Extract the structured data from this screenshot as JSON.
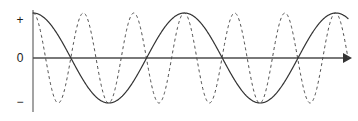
{
  "figure": {
    "title": "",
    "background_color": "#ffffff",
    "width": 358,
    "height": 121
  },
  "axes": {
    "x_axis": {
      "name": "horizontal-axis",
      "color": "#4d4d4d",
      "arrow": true,
      "arrow_direction": "right",
      "y_pixel": 58,
      "x_start_pixel": 33,
      "x_end_pixel": 350
    },
    "y_axis": {
      "name": "vertical-axis",
      "color": "#8c8c8c",
      "arrow": false,
      "x_pixel": 33,
      "y_top_pixel": 10,
      "y_bottom_pixel": 112
    },
    "tick_labels": {
      "positive": "+",
      "zero": "0",
      "negative": "−"
    }
  },
  "chart_data": {
    "type": "line",
    "title": "",
    "xlabel": "",
    "ylabel": "",
    "xlim": [
      0,
      1
    ],
    "ylim": [
      -1.15,
      1.15
    ],
    "grid": false,
    "legend": "none",
    "y_tick_labels": [
      "+",
      "0",
      "−"
    ],
    "y_tick_values": [
      1,
      0,
      -1
    ],
    "x_tick_labels": [],
    "annotations": [],
    "series": [
      {
        "name": "low-frequency-wave",
        "style": "solid",
        "color": "#333333",
        "line_width": 1.2,
        "waveform": "cosine",
        "amplitude": 1.0,
        "cycles": 2.08,
        "phase_degrees": 0,
        "description": "Solid cosine curve completing about two cycles across the plot",
        "key_points": {
          "starts_at": 1.0,
          "peaks_at_x": [
            0.0,
            0.48,
            0.97
          ],
          "troughs_at_x": [
            0.24,
            0.72
          ],
          "zero_crossings_x": [
            0.12,
            0.36,
            0.6,
            0.84
          ]
        }
      },
      {
        "name": "high-frequency-wave",
        "style": "dashed",
        "color": "#4d4d4d",
        "line_width": 1.0,
        "dash_pattern": "3,3",
        "waveform": "cosine",
        "amplitude": 1.0,
        "cycles": 6.25,
        "phase_degrees": 0,
        "description": "Dashed cosine curve completing about six cycles across the plot",
        "key_points": {
          "starts_at": 1.0,
          "peaks_at_x": [
            0.0,
            0.16,
            0.32,
            0.48,
            0.64,
            0.8,
            0.96
          ],
          "troughs_at_x": [
            0.08,
            0.24,
            0.4,
            0.56,
            0.72,
            0.88
          ],
          "zero_crossings_x": [
            0.04,
            0.12,
            0.2,
            0.28,
            0.36,
            0.44,
            0.52,
            0.6,
            0.68,
            0.76,
            0.84,
            0.92
          ]
        }
      }
    ]
  }
}
